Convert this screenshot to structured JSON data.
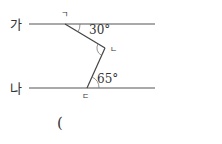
{
  "diagram": {
    "lines": [
      {
        "label": "가"
      },
      {
        "label": "나"
      }
    ],
    "points": {
      "a": "ㄱ",
      "b": "ㄴ",
      "c": "ㄷ"
    },
    "angles": {
      "top": "30°",
      "bottom": "65°"
    },
    "answer_paren": "("
  }
}
